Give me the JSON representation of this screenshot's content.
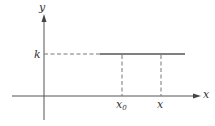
{
  "diagram": {
    "type": "constant-function-graph",
    "axes": {
      "x_label": "x",
      "y_label": "y"
    },
    "level_label": "k",
    "points": [
      {
        "label_main": "x",
        "label_sub": "0"
      },
      {
        "label_main": "x",
        "label_sub": ""
      }
    ],
    "colors": {
      "line": "#555555",
      "dash": "#777777",
      "text": "#333333"
    }
  }
}
